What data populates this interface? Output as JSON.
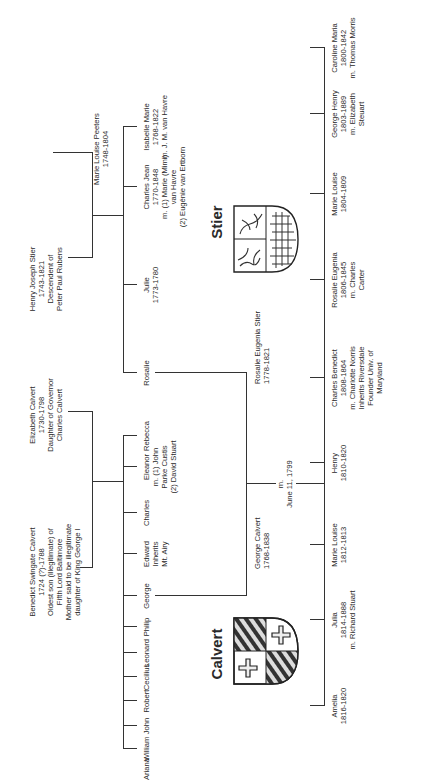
{
  "diagram": {
    "type": "family-tree",
    "orientation": "rotated-90",
    "generation_1": {
      "marie_louise_peeters": [
        "Marie Louise Peeters",
        "1748-1804"
      ],
      "henry_joseph_stier": [
        "Henry Joseph Stier",
        "1743-1821",
        "Descendent of",
        "Peter Paul Rubens"
      ],
      "elizabeth_calvert": [
        "Elizabeth Calvert",
        "1730-1798",
        "Daughter of Governor",
        "Charles Calvert"
      ],
      "benedict_swingate_calvert": [
        "Benedict Swingate Calvert",
        "1724 (?)-1788",
        "Oldest son (illegitimate) of",
        "Fifth Lord Baltimore",
        "Mother said to be illegitimate",
        "daughter of King George I"
      ]
    },
    "generation_2": {
      "stier_children": [
        [
          "Isabelle Marie",
          "1768-1822",
          "m. J. M. van Havre"
        ],
        [
          "Charles Jean",
          "1770-1848",
          "m. (1) Marie (Mimi)",
          "van Havre",
          "(2) Eugénie van Ertborn"
        ],
        [
          "Julie",
          "1773-1780"
        ],
        [
          "Rosalie"
        ]
      ],
      "calvert_children": [
        [
          "Rebecca"
        ],
        [
          "Eleanor",
          "m. (1) John",
          "Parke Custis",
          "(2) David Stuart"
        ],
        [
          "Charles"
        ],
        [
          "Edward",
          "Inherits",
          "Mt. Airy"
        ],
        [
          "George"
        ],
        [
          "Philip"
        ],
        [
          "Leonard"
        ],
        [
          "Cecilius"
        ],
        [
          "Robert"
        ],
        [
          "John"
        ],
        [
          "William"
        ],
        [
          "Ariana"
        ]
      ]
    },
    "marriage": {
      "bride": [
        "Rosalie Eugenia Stier",
        "1778-1821"
      ],
      "groom": [
        "George Calvert",
        "1768-1838"
      ],
      "label": [
        "m.",
        "June 11, 1799"
      ]
    },
    "generation_3": [
      [
        "Caroline Maria",
        "1800-1842",
        "m. Thomas Morris"
      ],
      [
        "George Henry",
        "1803-1889",
        "m. Elizabeth",
        "Steuart"
      ],
      [
        "Marie Louise",
        "1804-1809"
      ],
      [
        "Rosalie Eugenia",
        "1806-1845",
        "m. Charles",
        "Carter"
      ],
      [
        "Charles Benedict",
        "1808-1864",
        "m. Charlotte Norris",
        "Inherits Riversdale",
        "Founder Univ. of",
        "Maryland"
      ],
      [
        "Henry",
        "1810-1820"
      ],
      [
        "Marie Louise",
        "1812-1813"
      ],
      [
        "Julia",
        "1814-1888",
        "m. Richard Stuart"
      ],
      [
        "Amelia",
        "1816-1820"
      ]
    ],
    "crests": {
      "stier": "Stier",
      "calvert": "Calvert"
    }
  }
}
